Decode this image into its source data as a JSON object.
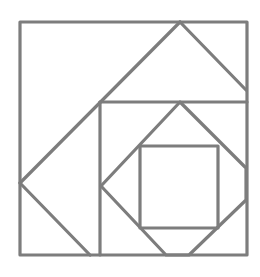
{
  "diagram": {
    "title": "",
    "stroke_color": "#7d7d7d",
    "background": "#ffffff",
    "shapes": [
      {
        "name": "outer-square",
        "points": [
          [
            20,
            22
          ],
          [
            247,
            22
          ],
          [
            247,
            255
          ],
          [
            20,
            255
          ]
        ],
        "closed": true
      },
      {
        "name": "large-triangle-left-edge",
        "points": [
          [
            20,
            183
          ],
          [
            180,
            22
          ]
        ],
        "closed": false
      },
      {
        "name": "large-triangle-right-edge",
        "points": [
          [
            180,
            22
          ],
          [
            246,
            90
          ]
        ],
        "closed": false
      },
      {
        "name": "bottom-left-diagonal",
        "points": [
          [
            20,
            183
          ],
          [
            90,
            255
          ]
        ],
        "closed": false
      },
      {
        "name": "inner-horizontal-line",
        "points": [
          [
            100,
            102
          ],
          [
            247,
            102
          ]
        ],
        "closed": false
      },
      {
        "name": "inner-vertical-line",
        "points": [
          [
            100,
            102
          ],
          [
            100,
            255
          ]
        ],
        "closed": false
      },
      {
        "name": "diamond",
        "points": [
          [
            180,
            102
          ],
          [
            246,
            168
          ],
          [
            246,
            200
          ],
          [
            189,
            255
          ],
          [
            166,
            255
          ],
          [
            101,
            186
          ]
        ],
        "closed": true
      },
      {
        "name": "inner-square",
        "points": [
          [
            140,
            146
          ],
          [
            218,
            146
          ],
          [
            218,
            228
          ],
          [
            140,
            228
          ]
        ],
        "closed": true
      }
    ]
  }
}
